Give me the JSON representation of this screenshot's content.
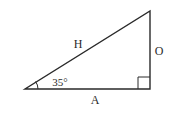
{
  "diagram": {
    "type": "right-triangle",
    "labels": {
      "hypotenuse": "H",
      "opposite": "O",
      "adjacent": "A",
      "angle": "35°"
    },
    "angle_degrees": 35,
    "vertices": {
      "left": [
        25,
        89
      ],
      "right_angle": [
        150,
        89
      ],
      "top": [
        150,
        11
      ]
    },
    "colors": {
      "stroke": "#2a2a2a",
      "background": "#ffffff"
    }
  }
}
